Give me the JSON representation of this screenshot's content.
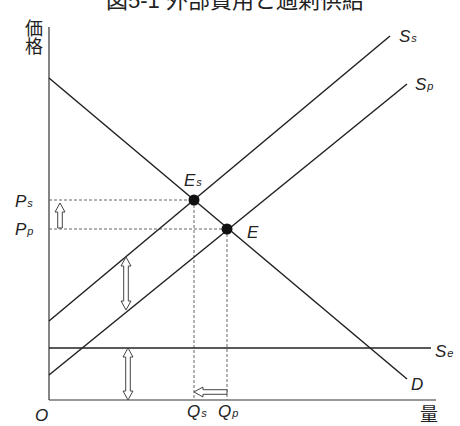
{
  "chart_data": {
    "type": "line",
    "title": "図5-1 外部費用と過剰供給",
    "xlabel": "量",
    "ylabel": "価格",
    "origin_label": "O",
    "grid": false,
    "legend": "none (curves labeled inline)",
    "axis_ranges": {
      "x": [
        0,
        387
      ],
      "y": [
        0,
        373
      ]
    },
    "series": [
      {
        "name": "D",
        "role": "demand",
        "points": [
          [
            0,
            322
          ],
          [
            358,
            21
          ]
        ],
        "label": {
          "main": "D",
          "sub": "",
          "pos": [
            362,
            10
          ]
        }
      },
      {
        "name": "Ss",
        "role": "social supply",
        "points": [
          [
            0,
            79
          ],
          [
            341,
            364
          ]
        ],
        "label": {
          "main": "S",
          "sub": "s",
          "pos": [
            350,
            358
          ]
        }
      },
      {
        "name": "Sp",
        "role": "private supply",
        "points": [
          [
            0,
            25
          ],
          [
            358,
            316
          ]
        ],
        "label": {
          "main": "S",
          "sub": "p",
          "pos": [
            366,
            310
          ]
        }
      },
      {
        "name": "Se",
        "role": "external cost",
        "points": [
          [
            0,
            52
          ],
          [
            382,
            52
          ]
        ],
        "label": {
          "main": "S",
          "sub": "e",
          "pos": [
            386,
            43
          ]
        }
      }
    ],
    "equilibria": [
      {
        "name": "Es",
        "x": 145,
        "y": 200,
        "label": {
          "main": "E",
          "sub": "s",
          "pos": [
            135,
            214
          ]
        }
      },
      {
        "name": "E",
        "x": 178,
        "y": 171,
        "label": {
          "main": "E",
          "sub": "",
          "pos": [
            198,
            162
          ]
        }
      }
    ],
    "price_levels": [
      {
        "name": "Ps",
        "y": 200,
        "to_x": 145,
        "label": {
          "main": "P",
          "sub": "s",
          "pos": [
            -34,
            193
          ]
        }
      },
      {
        "name": "Pp",
        "y": 171,
        "to_x": 178,
        "label": {
          "main": "P",
          "sub": "p",
          "pos": [
            -34,
            165
          ]
        }
      }
    ],
    "quantity_levels": [
      {
        "name": "Qs",
        "x": 145,
        "to_y": 200,
        "label": {
          "main": "Q",
          "sub": "s",
          "pos": [
            138,
            -17
          ]
        }
      },
      {
        "name": "Qp",
        "x": 178,
        "to_y": 171,
        "label": {
          "main": "Q",
          "sub": "p",
          "pos": [
            169,
            -17
          ]
        }
      }
    ],
    "annotations": [
      {
        "name": "price-rise-arrow",
        "kind": "single",
        "from": [
          11,
          172
        ],
        "to": [
          11,
          197
        ]
      },
      {
        "name": "external-cost-gap-arrow",
        "kind": "double",
        "from": [
          77,
          143
        ],
        "to": [
          77,
          90
        ]
      },
      {
        "name": "external-cost-level-arrow",
        "kind": "double",
        "from": [
          79,
          0
        ],
        "to": [
          79,
          52
        ]
      },
      {
        "name": "quantity-decrease-arrow",
        "kind": "single",
        "from": [
          178,
          8
        ],
        "to": [
          145,
          8
        ]
      }
    ]
  }
}
